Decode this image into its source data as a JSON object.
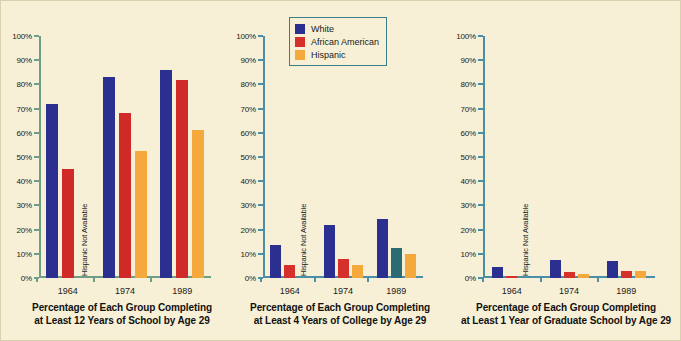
{
  "figure": {
    "background_color": "#f7f0d6",
    "border_color": "#d8d0ae"
  },
  "legend": {
    "border_color": "#3b7d87",
    "items": [
      {
        "label": "White",
        "color": "#2b2f8f"
      },
      {
        "label": "African American",
        "color": "#d5312a"
      },
      {
        "label": "Hispanic",
        "color": "#f5a83c"
      }
    ]
  },
  "missing_note": "Hispanic Not Available",
  "chart_data": [
    {
      "type": "bar",
      "title": "Percentage of Each Group Completing at Least 12 Years of School by Age 29",
      "caption_line1": "Percentage of Each Group Completing",
      "caption_line2": "at Least 12 Years of School by Age 29",
      "axis_color": "#6f9e86",
      "categories": [
        "1964",
        "1974",
        "1989"
      ],
      "xlabel": "",
      "ylabel": "",
      "ylim": [
        0,
        100
      ],
      "ytick_labels": [
        "0%",
        "10%",
        "20%",
        "30%",
        "40%",
        "50%",
        "60%",
        "70%",
        "80%",
        "90%",
        "100%"
      ],
      "ytick_values": [
        0,
        10,
        20,
        30,
        40,
        50,
        60,
        70,
        80,
        90,
        100
      ],
      "grid": false,
      "series": [
        {
          "name": "White",
          "color": "#2b2f8f",
          "values": [
            72,
            83,
            86
          ]
        },
        {
          "name": "African American",
          "color": "#cf2a27",
          "values": [
            45,
            68,
            82
          ]
        },
        {
          "name": "Hispanic",
          "color": "#f5a83c",
          "values": [
            null,
            52.5,
            61
          ]
        }
      ]
    },
    {
      "type": "bar",
      "title": "Percentage of Each Group Completing at Least 4 Years of College by Age 29",
      "caption_line1": "Percentage of Each Group Completing",
      "caption_line2": "at Least 4 Years of College by Age 29",
      "axis_color": "#4a8fa8",
      "categories": [
        "1964",
        "1974",
        "1989"
      ],
      "xlabel": "",
      "ylabel": "",
      "ylim": [
        0,
        100
      ],
      "ytick_labels": [
        "0%",
        "10%",
        "20%",
        "30%",
        "40%",
        "50%",
        "60%",
        "70%",
        "80%",
        "90%",
        "100%"
      ],
      "ytick_values": [
        0,
        10,
        20,
        30,
        40,
        50,
        60,
        70,
        80,
        90,
        100
      ],
      "grid": false,
      "series": [
        {
          "name": "White",
          "color": "#2b2f8f",
          "values": [
            13.5,
            22,
            24.5
          ]
        },
        {
          "name": "African American",
          "color": "#d5312a",
          "values": [
            5.5,
            8,
            12.5
          ],
          "value_colors": [
            "#d5312a",
            "#d5312a",
            "#2b6b73"
          ]
        },
        {
          "name": "Hispanic",
          "color": "#f5a83c",
          "values": [
            null,
            5.5,
            10
          ]
        }
      ]
    },
    {
      "type": "bar",
      "title": "Percentage of Each Group Completing at Least 1 Year of Graduate School by Age 29",
      "caption_line1": "Percentage of Each Group Completing",
      "caption_line2": "at Least 1 Year of Graduate School by Age 29",
      "axis_color": "#4a8fa8",
      "categories": [
        "1964",
        "1974",
        "1989"
      ],
      "xlabel": "",
      "ylabel": "",
      "ylim": [
        0,
        100
      ],
      "ytick_labels": [
        "0%",
        "10%",
        "20%",
        "30%",
        "40%",
        "50%",
        "60%",
        "70%",
        "80%",
        "90%",
        "100%"
      ],
      "ytick_values": [
        0,
        10,
        20,
        30,
        40,
        50,
        60,
        70,
        80,
        90,
        100
      ],
      "grid": false,
      "series": [
        {
          "name": "White",
          "color": "#2b2f8f",
          "values": [
            4.5,
            7.5,
            7
          ]
        },
        {
          "name": "African American",
          "color": "#d5312a",
          "values": [
            1,
            2.5,
            3
          ]
        },
        {
          "name": "Hispanic",
          "color": "#f5a83c",
          "values": [
            null,
            1.5,
            3
          ]
        }
      ]
    }
  ]
}
